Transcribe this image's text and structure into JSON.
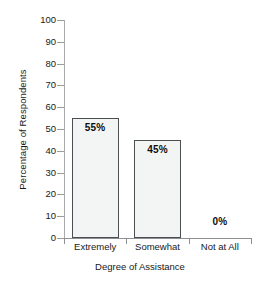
{
  "chart_data": {
    "type": "bar",
    "title": "",
    "subtitle": "",
    "xlabel": "Degree of Assistance",
    "ylabel": "Percentage of Respondents",
    "categories": [
      "Extremely",
      "Somewhat",
      "Not at All"
    ],
    "values": [
      55,
      45,
      0
    ],
    "data_labels": [
      "55%",
      "45%",
      "0%"
    ],
    "ylim": [
      0,
      100
    ],
    "ytick_labels": [
      "100",
      "90",
      "80",
      "70",
      "60",
      "50",
      "40",
      "30",
      "20",
      "10",
      "0"
    ],
    "ytick_values": [
      100,
      90,
      80,
      70,
      60,
      50,
      40,
      30,
      20,
      10,
      0
    ],
    "grid": false,
    "legend": false,
    "legend_position": "none",
    "bar_fill_color": "#f3f4f4",
    "bar_border_color": "#4c4f51",
    "axis_color": "#8d9092",
    "text_color": "#17191a"
  }
}
